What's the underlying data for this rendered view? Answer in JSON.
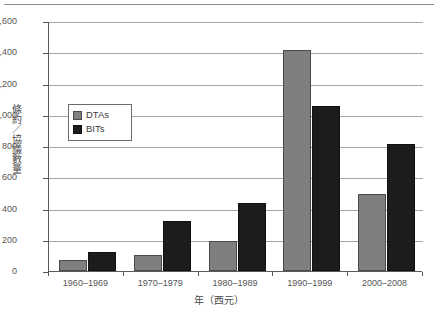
{
  "chart_data": {
    "type": "bar",
    "title": "",
    "subtitle": "",
    "xlabel": "年（西元）",
    "ylabel": "條約／協議數量",
    "categories": [
      "1960–1969",
      "1970–1979",
      "1980–1989",
      "1990–1999",
      "2000–2008"
    ],
    "series": [
      {
        "name": "DTAs",
        "color": "#7f7f7f",
        "values": [
          70,
          100,
          190,
          1415,
          490
        ]
      },
      {
        "name": "BITs",
        "color": "#1c1c1c",
        "values": [
          120,
          320,
          435,
          1055,
          815
        ]
      }
    ],
    "ylim": [
      0,
      1600
    ],
    "ytick_step": 200,
    "ytick_labels": [
      "0",
      "200",
      "400",
      "600",
      "800",
      "1,000",
      "1,200",
      "1,400",
      "1,600"
    ],
    "grid": true,
    "legend_position": "inside-left"
  },
  "legend": {
    "items": [
      {
        "label": "DTAs",
        "swatch": "gray-square-swatch"
      },
      {
        "label": "BITs",
        "swatch": "black-square-swatch"
      }
    ]
  }
}
